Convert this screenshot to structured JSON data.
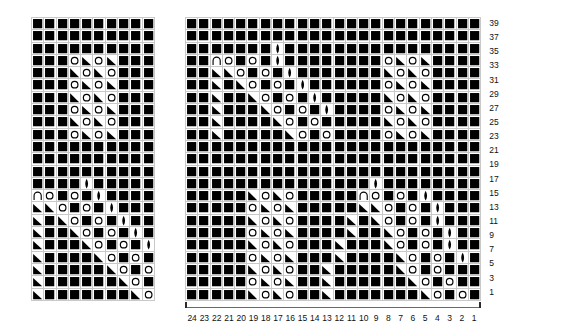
{
  "doc": {
    "title": "Knitting Stitch Chart",
    "background": "#ffffff",
    "grid_line_color": "#c9c9c9",
    "symbol_color": "#000000"
  },
  "legend_symbols": {
    "knit": "filled-square",
    "yarn_over": "open-circle",
    "k2tog": "right-triangle",
    "ssk": "left-triangle",
    "make_one": "vertical-lens",
    "bind_off": "arch"
  },
  "charts": [
    {
      "name": "left-chart",
      "x": 31,
      "y": 17,
      "cols": 10,
      "rows": 23,
      "has_row_numbers": false,
      "has_col_axis": false,
      "cells": [
        "SSSSSSSSSS",
        "SSSSSSSSSS",
        "SSSSSSSSSS",
        "SSSOLOLSSS",
        "SSSROROSSS",
        "SSSOLOLSSS",
        "SSSROROSSS",
        "SSSOLOLSSS",
        "SSSROROSSS",
        "SSSOLOLSSS",
        "SSSSSSSSSS",
        "SSSSSSSSSS",
        "SSSSSSSSSS",
        "SSSSDSSSSS",
        "AOSOSDSSSS",
        "LROSOSDSSS",
        "LSROSOSDSS",
        "LSSROSOSDS",
        "LSSSROSOSD",
        "LSSSSROSOS",
        "LSSSSSROSO",
        "LSSSSSSROS",
        "LSSSSSSSRO"
      ]
    },
    {
      "name": "right-chart",
      "x": 185,
      "y": 17,
      "cols": 24,
      "rows": 23,
      "has_row_numbers": true,
      "has_col_axis": true,
      "cells": [
        "SSSSSSSSSSSSSSSSSSSSSSSS",
        "SSSSSSSSSSSSSSSSSSSSSSSS",
        "SSSSSSSDSSSSSSSSSSSSSSSS",
        "SSAOSOSDSSSSSSSSOLOLSSSS",
        "SSLROSOSDSSSSSSSROROSSSS",
        "SSLSROSOSDSSSSSSOLOLSSSS",
        "SSLSSROSOSDSSSSSROROSSSS",
        "SSLSSSROSOSDSSSSOLOLSSSS",
        "SSLSSSSROSOSSSSSROROSSSS",
        "SSLSSSSSROSOSSSSOLOLSSSS",
        "SSSSSSSSSSSSSSSSSSSSSSSS",
        "SSSSSSSSSSSSSSSSSSSSSSSS",
        "SSSSSSSSSSSSSSSSSSSSSSSS",
        "SSSSSSSSSSSSSSSDSSSSSSSS",
        "SSSSSROROSSSSSAOSOSDSSSS",
        "SSSSSOLOLSSSSSLROSOSDSSS",
        "SSSSSROROSSSSLSROSOSDSSS",
        "SSSSSOLOLSSSSLSSROSOSDSS",
        "SSSSSROROSSSLSSSROSOSDSS",
        "SSSSSOLOLSSSLSSSSROSOSDS",
        "SSSSSROROSSLSSSSSROSOSSS",
        "SSSSSOLOLSSLSSSSSSROSOSS",
        "SSSSSROROSSLSSSSSSSROSOS"
      ],
      "row_numbers": [
        39,
        37,
        35,
        33,
        31,
        29,
        27,
        25,
        23,
        21,
        19,
        17,
        15,
        13,
        11,
        9,
        7,
        5,
        3,
        1
      ],
      "col_numbers": [
        24,
        23,
        22,
        21,
        20,
        19,
        18,
        17,
        16,
        15,
        14,
        13,
        12,
        11,
        10,
        9,
        8,
        7,
        6,
        5,
        4,
        3,
        2,
        1
      ]
    }
  ]
}
